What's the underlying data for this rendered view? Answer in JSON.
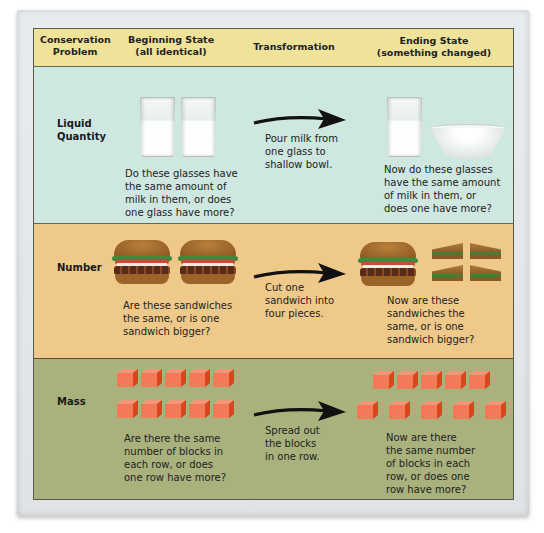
{
  "header": {
    "col1": "Conservation\nProblem",
    "col2": "Beginning State\n(all identical)",
    "col3": "Transformation",
    "col4": "Ending State\n(something changed)"
  },
  "rows": [
    {
      "label": "Liquid\nQuantity",
      "beginning_text": "Do these glasses have\nthe same amount of\nmilk in them, or does\none glass have more?",
      "transformation": "Pour milk from\none glass to\nshallow bowl.",
      "ending_text": "Now do these glasses\nhave the same amount\nof milk in them, or\ndoes one have more?",
      "beginning_images": [
        "glass-of-milk",
        "glass-of-milk"
      ],
      "ending_images": [
        "glass-of-milk",
        "shallow-bowl"
      ]
    },
    {
      "label": "Number",
      "beginning_text": "Are these sandwiches\nthe same, or is one\nsandwich bigger?",
      "transformation": "Cut one\nsandwich into\nfour pieces.",
      "ending_text": "Now are these\nsandwiches the\nsame, or is one\nsandwich bigger?",
      "beginning_images": [
        "sandwich",
        "sandwich"
      ],
      "ending_images": [
        "sandwich",
        "sandwich-quarter",
        "sandwich-quarter",
        "sandwich-quarter",
        "sandwich-quarter"
      ]
    },
    {
      "label": "Mass",
      "beginning_text": "Are there the same\nnumber of blocks in\neach row, or does\none row have more?",
      "transformation": "Spread out\nthe blocks\nin one row.",
      "ending_text": "Now  are there\nthe same number\nof blocks in each\nrow, or does one\nrow have more?",
      "beginning_blocks": {
        "row1": 5,
        "row2": 5
      },
      "ending_blocks": {
        "row1": 5,
        "row2": 5
      }
    }
  ],
  "colors": {
    "header_bg": "#efe39a",
    "liquid_bg": "#cfe7e1",
    "number_bg": "#efc98a",
    "mass_bg": "#a9b17c",
    "block_front": "#f27a58",
    "block_side": "#d9461e",
    "arrow": "#111111"
  }
}
